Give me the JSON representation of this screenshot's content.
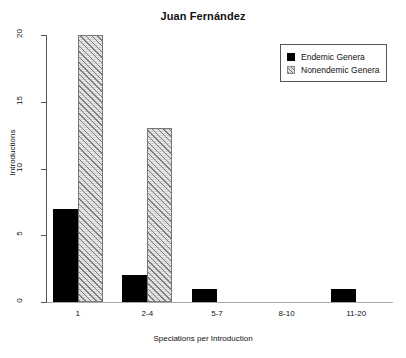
{
  "chart_data": {
    "type": "bar",
    "title": "Juan Fernández",
    "xlabel": "Speciations per Introduction",
    "ylabel": "Introductions",
    "categories": [
      "1",
      "2-4",
      "5-7",
      "8-10",
      "11-20"
    ],
    "series": [
      {
        "name": "Endemic Genera",
        "values": [
          7,
          2,
          1,
          0,
          1
        ],
        "color": "#000000",
        "fill": "solid"
      },
      {
        "name": "Nonendemic Genera",
        "values": [
          20,
          13,
          0,
          0,
          0
        ],
        "color": "#d2d2d2",
        "fill": "diagonal-hatch"
      }
    ],
    "ylim": [
      0,
      20
    ],
    "yticks": [
      0,
      5,
      10,
      15,
      20
    ],
    "ytick_labels": [
      "0",
      "5",
      "10",
      "15",
      "20"
    ],
    "grid": false,
    "legend_position": "top-right",
    "legend_entries": [
      "Endemic Genera",
      "Nonendemic Genera"
    ]
  },
  "legend": {
    "items": [
      {
        "label": "Endemic Genera",
        "swatch": "solid-black-square-icon"
      },
      {
        "label": "Nonendemic Genera",
        "swatch": "hatched-gray-square-icon"
      }
    ]
  },
  "axes": {
    "y_title": "Introductions",
    "x_title": "Speciations per Introduction",
    "y_ticks": [
      "0",
      "5",
      "10",
      "15",
      "20"
    ],
    "x_ticks": [
      "1",
      "2-4",
      "5-7",
      "8-10",
      "11-20"
    ]
  }
}
